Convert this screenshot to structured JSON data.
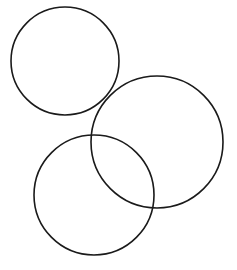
{
  "diagram": {
    "background": "#ffffff",
    "stroke_color": "#1a1a1a",
    "stroke_width": 1.6,
    "circles": [
      {
        "id": "circle-top-left",
        "cx": 65,
        "cy": 61,
        "r": 54
      },
      {
        "id": "circle-right",
        "cx": 157,
        "cy": 142,
        "r": 66
      },
      {
        "id": "circle-bottom",
        "cx": 94,
        "cy": 195,
        "r": 60
      }
    ]
  }
}
